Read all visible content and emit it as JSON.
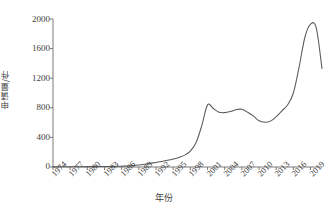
{
  "chart_data": {
    "type": "line",
    "title": "",
    "xlabel": "年份",
    "ylabel": "申请量/件",
    "xlim": [
      1974,
      2021
    ],
    "ylim": [
      0,
      2000
    ],
    "grid": false,
    "legend": null,
    "xtick_labels": [
      "1974",
      "1977",
      "1980",
      "1983",
      "1986",
      "1989",
      "1992",
      "1995",
      "1998",
      "2001",
      "2004",
      "2007",
      "2010",
      "2013",
      "2016",
      "2019"
    ],
    "ytick_labels": [
      "0",
      "400",
      "800",
      "1200",
      "1600",
      "2000"
    ],
    "series": [
      {
        "name": "申请量",
        "color": "#595959",
        "x": [
          1974,
          1975,
          1976,
          1977,
          1978,
          1979,
          1980,
          1981,
          1982,
          1983,
          1984,
          1985,
          1986,
          1987,
          1988,
          1989,
          1990,
          1991,
          1992,
          1993,
          1994,
          1995,
          1996,
          1997,
          1998,
          1999,
          2000,
          2001,
          2002,
          2003,
          2004,
          2005,
          2006,
          2007,
          2008,
          2009,
          2010,
          2011,
          2012,
          2013,
          2014,
          2015,
          2016,
          2017,
          2018,
          2019,
          2020,
          2021
        ],
        "values": [
          2,
          2,
          3,
          3,
          4,
          4,
          5,
          5,
          6,
          7,
          8,
          9,
          11,
          14,
          20,
          28,
          38,
          50,
          62,
          75,
          90,
          108,
          130,
          160,
          215,
          330,
          560,
          840,
          790,
          740,
          735,
          750,
          775,
          780,
          740,
          690,
          625,
          605,
          620,
          680,
          760,
          840,
          1000,
          1350,
          1750,
          1930,
          1880,
          1330
        ]
      }
    ]
  },
  "figure": {
    "caption": ""
  }
}
